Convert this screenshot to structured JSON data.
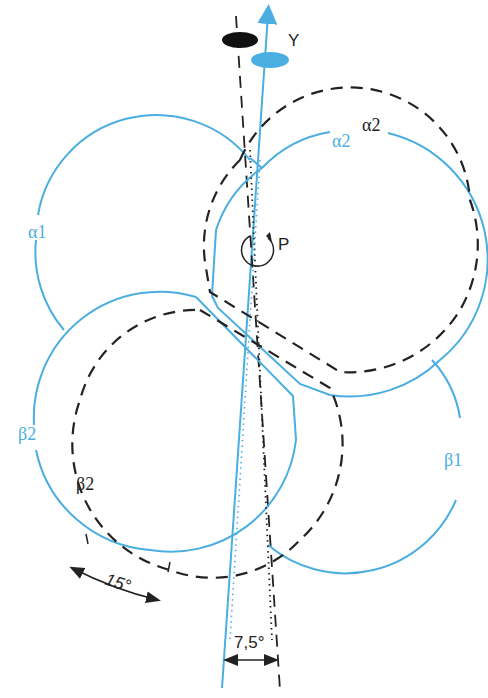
{
  "diagram": {
    "labels": {
      "y_axis": "Y",
      "pivot": "P",
      "alpha1": "α1",
      "alpha2_blue": "α2",
      "alpha2_black": "α2",
      "beta1": "β1",
      "beta2_blue": "β2",
      "beta2_black": "β2",
      "angle_15": "15°",
      "angle_7_5": "7,5°"
    },
    "colors": {
      "blue": "#4aaee0",
      "black": "#222222"
    }
  }
}
